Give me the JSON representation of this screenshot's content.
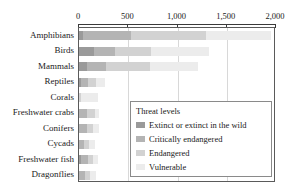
{
  "chart_data": {
    "type": "bar",
    "orientation": "horizontal",
    "stacked": true,
    "title": "",
    "xlabel": "",
    "ylabel": "",
    "xlim": [
      0,
      2000
    ],
    "grid": true,
    "grid_axis": "x",
    "legend_position": "inside-lower-right",
    "xticks": [
      0,
      500,
      1000,
      1500,
      2000
    ],
    "xtick_labels": [
      "0",
      "500",
      "1,000",
      "1,500",
      "2,000"
    ],
    "categories": [
      "Amphibians",
      "Birds",
      "Mammals",
      "Reptiles",
      "Corals",
      "Freshwater crabs",
      "Conifers",
      "Cycads",
      "Freshwater fish",
      "Dragonflies"
    ],
    "legend_title": "Threat levels",
    "series": [
      {
        "name": "Extinct or extinct in the wild",
        "color": "#9a9a9a",
        "values": [
          40,
          155,
          80,
          25,
          0,
          0,
          5,
          5,
          20,
          5
        ]
      },
      {
        "name": "Critically endangered",
        "color": "#b4b4b4",
        "values": [
          490,
          215,
          190,
          70,
          5,
          85,
          80,
          50,
          70,
          55
        ]
      },
      {
        "name": "Endangered",
        "color": "#d2d2d2",
        "values": [
          760,
          360,
          450,
          80,
          20,
          75,
          55,
          50,
          50,
          50
        ]
      },
      {
        "name": "Vulnerable",
        "color": "#ececec",
        "values": [
          660,
          595,
          490,
          90,
          170,
          45,
          60,
          60,
          55,
          60
        ]
      }
    ],
    "totals": [
      1950,
      1325,
      1210,
      265,
      195,
      205,
      200,
      165,
      195,
      170
    ]
  },
  "axis": {
    "tick_labels": [
      "0",
      "500",
      "1,000",
      "1,500",
      "2,000"
    ]
  },
  "legend": {
    "title": "Threat levels",
    "items": [
      {
        "label": "Extinct or extinct in the wild",
        "color": "#9a9a9a"
      },
      {
        "label": "Critically endangered",
        "color": "#b4b4b4"
      },
      {
        "label": "Endangered",
        "color": "#d2d2d2"
      },
      {
        "label": "Vulnerable",
        "color": "#ececec"
      }
    ]
  },
  "colors": {
    "axis": "#3a3a3a",
    "frame": "#5a5a5a",
    "grid": "#d8d8d8",
    "text": "#1a1a1a",
    "background": "#ffffff"
  }
}
